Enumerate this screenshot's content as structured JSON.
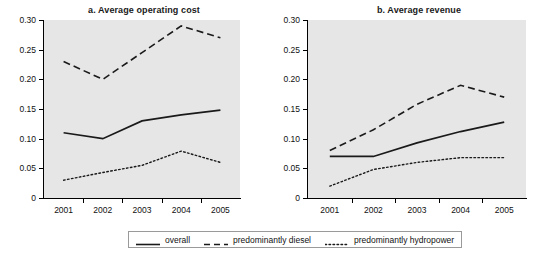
{
  "chart_data": [
    {
      "type": "line",
      "title": "a. Average operating cost",
      "panel": "a",
      "xlabel": "",
      "ylabel": "",
      "categories": [
        "2001",
        "2002",
        "2003",
        "2004",
        "2005"
      ],
      "ylim": [
        0,
        0.3
      ],
      "yticks": [
        0,
        0.05,
        0.1,
        0.15,
        0.2,
        0.25,
        0.3
      ],
      "ytick_labels": [
        "0",
        "0.05",
        "0.10",
        "0.15",
        "0.20",
        "0.25",
        "0.30"
      ],
      "grid": false,
      "legend_position": "bottom",
      "series": [
        {
          "name": "overall",
          "style": "solid",
          "values": [
            0.11,
            0.1,
            0.13,
            0.14,
            0.148
          ]
        },
        {
          "name": "predominantly diesel",
          "style": "dashed",
          "values": [
            0.23,
            0.2,
            0.245,
            0.29,
            0.27
          ]
        },
        {
          "name": "predominantly hydropower",
          "style": "dotted",
          "values": [
            0.03,
            0.043,
            0.055,
            0.079,
            0.06
          ]
        }
      ]
    },
    {
      "type": "line",
      "title": "b. Average revenue",
      "panel": "b",
      "xlabel": "",
      "ylabel": "",
      "categories": [
        "2001",
        "2002",
        "2003",
        "2004",
        "2005"
      ],
      "ylim": [
        0,
        0.3
      ],
      "yticks": [
        0,
        0.05,
        0.1,
        0.15,
        0.2,
        0.25,
        0.3
      ],
      "ytick_labels": [
        "0",
        "0.05",
        "0.10",
        "0.15",
        "0.20",
        "0.25",
        "0.30"
      ],
      "grid": false,
      "legend_position": "bottom",
      "series": [
        {
          "name": "overall",
          "style": "solid",
          "values": [
            0.07,
            0.07,
            0.093,
            0.112,
            0.128
          ]
        },
        {
          "name": "predominantly diesel",
          "style": "dashed",
          "values": [
            0.08,
            0.115,
            0.158,
            0.19,
            0.17
          ]
        },
        {
          "name": "predominantly hydropower",
          "style": "dotted",
          "values": [
            0.02,
            0.048,
            0.06,
            0.068,
            0.068
          ]
        }
      ]
    }
  ],
  "legend": {
    "items": [
      {
        "label": "overall",
        "style": "solid"
      },
      {
        "label": "predominantly diesel",
        "style": "dashed"
      },
      {
        "label": "predominantly hydropower",
        "style": "dotted"
      }
    ]
  },
  "colors": {
    "plot_background": "#e6e6e6",
    "page_background": "#ffffff",
    "line": "#1a1a1a",
    "axis": "#000000",
    "text": "#111111"
  }
}
